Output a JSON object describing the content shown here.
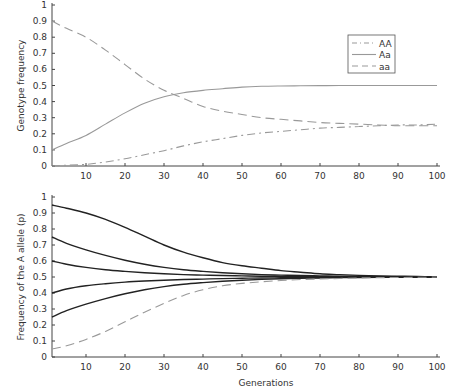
{
  "chart_data": [
    {
      "type": "line",
      "title": "",
      "xlabel": "",
      "ylabel": "Genotype frequency",
      "xlim": [
        1,
        100
      ],
      "ylim": [
        0,
        1
      ],
      "xticks": [
        10,
        20,
        30,
        40,
        50,
        60,
        70,
        80,
        90,
        100
      ],
      "yticks": [
        0,
        0.1,
        0.2,
        0.3,
        0.4,
        0.5,
        0.6,
        0.7,
        0.8,
        0.9,
        1
      ],
      "ytick_labels": [
        "0",
        "0.1",
        "0.2",
        "0.3",
        "0.4",
        "0.5",
        "0.6",
        "0.7",
        "0.8",
        "0.9",
        "1"
      ],
      "grid": false,
      "legend_position": "upper right",
      "x": [
        1,
        5,
        10,
        15,
        20,
        25,
        30,
        35,
        40,
        45,
        50,
        55,
        60,
        65,
        70,
        75,
        80,
        85,
        90,
        95,
        100
      ],
      "series": [
        {
          "name": "AA",
          "style": "dashdot",
          "color": "#999999",
          "values": [
            0.0,
            0.005,
            0.01,
            0.025,
            0.045,
            0.07,
            0.095,
            0.125,
            0.15,
            0.17,
            0.19,
            0.205,
            0.215,
            0.225,
            0.235,
            0.24,
            0.245,
            0.25,
            0.255,
            0.255,
            0.26
          ]
        },
        {
          "name": "Aa",
          "style": "solid",
          "color": "#999999",
          "values": [
            0.1,
            0.14,
            0.19,
            0.26,
            0.33,
            0.39,
            0.43,
            0.455,
            0.47,
            0.48,
            0.49,
            0.495,
            0.497,
            0.498,
            0.499,
            0.5,
            0.5,
            0.5,
            0.5,
            0.5,
            0.5
          ]
        },
        {
          "name": "aa",
          "style": "dashed",
          "color": "#999999",
          "values": [
            0.9,
            0.855,
            0.8,
            0.72,
            0.63,
            0.54,
            0.47,
            0.42,
            0.37,
            0.34,
            0.32,
            0.3,
            0.29,
            0.28,
            0.27,
            0.265,
            0.26,
            0.255,
            0.25,
            0.25,
            0.25
          ]
        }
      ]
    },
    {
      "type": "line",
      "title": "",
      "xlabel": "Generations",
      "ylabel": "Frequency of the A allele (p)",
      "xlim": [
        1,
        100
      ],
      "ylim": [
        0,
        1
      ],
      "xticks": [
        10,
        20,
        30,
        40,
        50,
        60,
        70,
        80,
        90,
        100
      ],
      "yticks": [
        0,
        0.1,
        0.2,
        0.3,
        0.4,
        0.5,
        0.6,
        0.7,
        0.8,
        0.9,
        1
      ],
      "ytick_labels": [
        "0",
        "0.1",
        "0.2",
        "0.3",
        "0.4",
        "0.5",
        "0.6",
        "0.7",
        "0.8",
        "0.9",
        "1"
      ],
      "grid": false,
      "x": [
        1,
        5,
        10,
        15,
        20,
        25,
        30,
        35,
        40,
        45,
        50,
        55,
        60,
        65,
        70,
        75,
        80,
        85,
        90,
        95,
        100
      ],
      "series": [
        {
          "name": "p0 = 0.95",
          "style": "solid",
          "color": "#222222",
          "values": [
            0.95,
            0.93,
            0.9,
            0.86,
            0.81,
            0.755,
            0.7,
            0.655,
            0.62,
            0.59,
            0.57,
            0.555,
            0.54,
            0.53,
            0.52,
            0.515,
            0.51,
            0.507,
            0.505,
            0.503,
            0.502
          ]
        },
        {
          "name": "p0 = 0.75",
          "style": "solid",
          "color": "#222222",
          "values": [
            0.75,
            0.71,
            0.67,
            0.635,
            0.605,
            0.58,
            0.56,
            0.545,
            0.535,
            0.527,
            0.52,
            0.515,
            0.512,
            0.509,
            0.507,
            0.505,
            0.504,
            0.503,
            0.502,
            0.501,
            0.5
          ]
        },
        {
          "name": "p0 = 0.6",
          "style": "solid",
          "color": "#222222",
          "values": [
            0.6,
            0.58,
            0.56,
            0.545,
            0.535,
            0.527,
            0.52,
            0.515,
            0.512,
            0.509,
            0.507,
            0.505,
            0.504,
            0.503,
            0.502,
            0.501,
            0.501,
            0.5,
            0.5,
            0.5,
            0.5
          ]
        },
        {
          "name": "p0 = 0.4",
          "style": "solid",
          "color": "#222222",
          "values": [
            0.4,
            0.425,
            0.445,
            0.458,
            0.468,
            0.475,
            0.48,
            0.484,
            0.487,
            0.49,
            0.492,
            0.494,
            0.495,
            0.496,
            0.497,
            0.498,
            0.499,
            0.499,
            0.5,
            0.5,
            0.5
          ]
        },
        {
          "name": "p0 = 0.25",
          "style": "solid",
          "color": "#222222",
          "values": [
            0.25,
            0.29,
            0.33,
            0.365,
            0.395,
            0.42,
            0.44,
            0.455,
            0.465,
            0.473,
            0.48,
            0.485,
            0.489,
            0.492,
            0.494,
            0.496,
            0.497,
            0.498,
            0.499,
            0.5,
            0.5
          ]
        },
        {
          "name": "p0 = 0.05",
          "style": "dashed",
          "color": "#999999",
          "values": [
            0.05,
            0.07,
            0.11,
            0.16,
            0.22,
            0.28,
            0.335,
            0.385,
            0.42,
            0.445,
            0.46,
            0.47,
            0.478,
            0.484,
            0.488,
            0.491,
            0.494,
            0.496,
            0.497,
            0.498,
            0.5
          ]
        }
      ]
    }
  ]
}
